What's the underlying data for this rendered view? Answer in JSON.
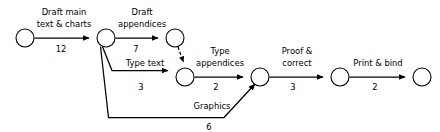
{
  "diagram": {
    "type": "activity-on-arrow-network",
    "background_color": "#ffffff",
    "line_color": "#000000",
    "node_fill": "#ffffff",
    "node_radius": 9
  },
  "nodes": [
    {
      "id": "n1",
      "label": "",
      "cx": 25,
      "cy": 38
    },
    {
      "id": "n2",
      "label": "",
      "cx": 106,
      "cy": 38
    },
    {
      "id": "n3",
      "label": "",
      "cx": 175,
      "cy": 38
    },
    {
      "id": "n4",
      "label": "",
      "cx": 185,
      "cy": 77
    },
    {
      "id": "n5",
      "label": "",
      "cx": 260,
      "cy": 77
    },
    {
      "id": "n6",
      "label": "",
      "cx": 340,
      "cy": 77
    },
    {
      "id": "n7",
      "label": "",
      "cx": 422,
      "cy": 77
    }
  ],
  "activities": [
    {
      "id": "a1",
      "name": "draft-main-text-and-charts",
      "name_lines": [
        "Draft main",
        "text & charts"
      ],
      "duration": "12",
      "from": "n1",
      "to": "n2",
      "style": "solid"
    },
    {
      "id": "a2",
      "name": "draft-appendices",
      "name_lines": [
        "Draft",
        "appendices"
      ],
      "duration": "7",
      "from": "n2",
      "to": "n3",
      "style": "solid"
    },
    {
      "id": "a3",
      "name": "type-text",
      "name_lines": [
        "Type text"
      ],
      "duration": "3",
      "from": "n2",
      "to": "n4",
      "style": "solid"
    },
    {
      "id": "a4",
      "name": "dummy",
      "name_lines": [],
      "duration": "",
      "from": "n3",
      "to": "n4",
      "style": "dashed"
    },
    {
      "id": "a5",
      "name": "type-appendices",
      "name_lines": [
        "Type",
        "appendices"
      ],
      "duration": "2",
      "from": "n4",
      "to": "n5",
      "style": "solid"
    },
    {
      "id": "a6",
      "name": "graphics",
      "name_lines": [
        "Graphics"
      ],
      "duration": "6",
      "from": "n2",
      "to": "n5",
      "style": "solid"
    },
    {
      "id": "a7",
      "name": "proof-and-correct",
      "name_lines": [
        "Proof &",
        "correct"
      ],
      "duration": "3",
      "from": "n5",
      "to": "n6",
      "style": "solid"
    },
    {
      "id": "a8",
      "name": "print-and-bind",
      "name_lines": [
        "Print & bind"
      ],
      "duration": "2",
      "from": "n6",
      "to": "n7",
      "style": "solid"
    }
  ],
  "labels": {
    "a1_line1": "Draft main",
    "a1_line2": "text & charts",
    "a1_duration": "12",
    "a2_line1": "Draft",
    "a2_line2": "appendices",
    "a2_duration": "7",
    "a3_line1": "Type text",
    "a3_duration": "3",
    "a5_line1": "Type",
    "a5_line2": "appendices",
    "a5_duration": "2",
    "a6_line1": "Graphics",
    "a6_duration": "6",
    "a7_line1": "Proof &",
    "a7_line2": "correct",
    "a7_duration": "3",
    "a8_line1": "Print & bind",
    "a8_duration": "2"
  }
}
